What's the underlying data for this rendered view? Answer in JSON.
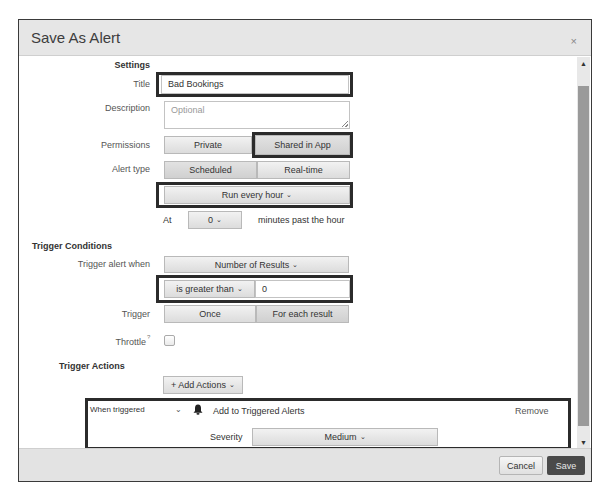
{
  "dialog": {
    "title": "Save As Alert",
    "close_icon": "×"
  },
  "settings": {
    "section_label": "Settings",
    "title_label": "Title",
    "title_value": "Bad Bookings",
    "description_label": "Description",
    "description_placeholder": "Optional",
    "permissions_label": "Permissions",
    "permissions_options": [
      "Private",
      "Shared in App"
    ],
    "permissions_selected": "Shared in App",
    "alert_type_label": "Alert type",
    "alert_type_options": [
      "Scheduled",
      "Real-time"
    ],
    "alert_type_selected": "Scheduled",
    "schedule_value": "Run every hour",
    "at_label": "At",
    "at_minute_value": "0",
    "minutes_suffix": "minutes past the hour"
  },
  "trigger_conditions": {
    "section_label": "Trigger Conditions",
    "trigger_when_label": "Trigger alert when",
    "trigger_when_value": "Number of Results",
    "comparator_value": "is greater than",
    "threshold_value": "0",
    "trigger_label": "Trigger",
    "trigger_options": [
      "Once",
      "For each result"
    ],
    "trigger_selected": "Once",
    "throttle_label": "Throttle",
    "throttle_help": "?",
    "throttle_checked": false
  },
  "trigger_actions": {
    "section_label": "Trigger Actions",
    "add_actions_label": "+ Add Actions",
    "when_triggered_label": "When triggered",
    "action_name": "Add to Triggered Alerts",
    "remove_label": "Remove",
    "severity_label": "Severity",
    "severity_value": "Medium"
  },
  "footer": {
    "cancel_label": "Cancel",
    "save_label": "Save"
  },
  "colors": {
    "save_button": "#4a4a4a",
    "highlight_border": "#2b2b2b",
    "header_bg": "#e6e6e6"
  }
}
